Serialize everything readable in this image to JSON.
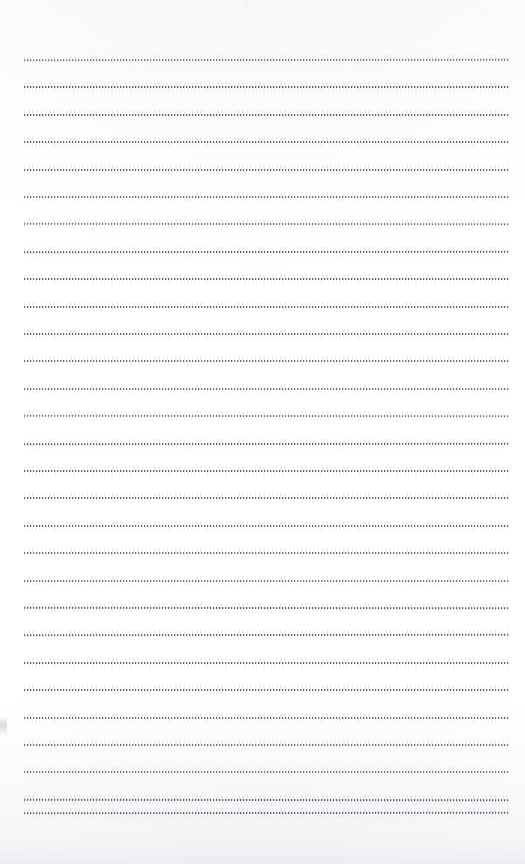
{
  "document": {
    "kind": "scanned-lined-paper",
    "title": "",
    "body_text": "",
    "page_width": 525,
    "page_height": 864,
    "background_color": "#ffffff",
    "is_blank": true
  },
  "ruling": {
    "line_color": "#46464e",
    "line_halo_color": "#c4c5ce",
    "style": "dotted",
    "line_count": 29,
    "first_line_y": 59,
    "line_spacing": 27.4,
    "left_margin_x": 24,
    "right_end_x": 509,
    "line_thickness": 2,
    "lines_y": [
      59,
      86.4,
      113.8,
      141.2,
      168.6,
      196,
      223.4,
      250.8,
      278.2,
      305.6,
      333,
      360.4,
      387.8,
      415.2,
      442.6,
      470,
      497.4,
      524.8,
      552.2,
      579.6,
      607,
      634.4,
      661.8,
      689.2,
      716.6,
      744,
      771.4,
      798.8,
      812
    ]
  },
  "artifacts": {
    "top_speckle_band": true,
    "bottom_shadow_band": true,
    "left_edge_smudge": true,
    "left_edge_smudge_y": 716
  }
}
